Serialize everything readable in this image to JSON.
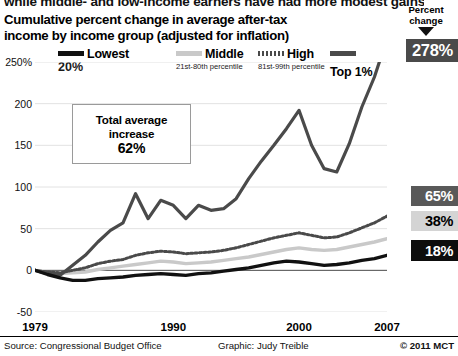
{
  "kicker": "while middle- and low-income earners have had more modest gains.",
  "title": {
    "line1": "Cumulative percent change in average after-tax",
    "line2": "income by income group (adjusted for inflation)"
  },
  "legend": [
    {
      "label": "Lowest",
      "sub_bold": "20%",
      "sub": "",
      "style": "solid-black",
      "color": "#111111"
    },
    {
      "label": "Middle",
      "sub_bold": "",
      "sub": "21st-80th\npercentile",
      "style": "solid-light",
      "color": "#c9c9c9"
    },
    {
      "label": "High",
      "sub_bold": "",
      "sub": "81st-99th\npercentile",
      "style": "dotted",
      "color": "#4a4a4a"
    },
    {
      "label": "Top 1%",
      "sub_bold": "",
      "sub": "",
      "style": "solid-dark",
      "color": "#4a4a4a"
    }
  ],
  "annotation_box": {
    "line1": "Total average",
    "line2": "increase",
    "value": "62%"
  },
  "percent_change_header": {
    "line1": "Percent",
    "line2": "change"
  },
  "callouts": [
    {
      "name": "top1",
      "value": "278%",
      "bg": "#4a4a4a",
      "fg": "#ffffff"
    },
    {
      "name": "high",
      "value": "65%",
      "bg": "#595959",
      "fg": "#ffffff"
    },
    {
      "name": "middle",
      "value": "38%",
      "bg": "#d4d4d4",
      "fg": "#000000"
    },
    {
      "name": "lowest",
      "value": "18%",
      "bg": "#0d0d0d",
      "fg": "#ffffff"
    }
  ],
  "footer": {
    "source": "Source: Congressional Budget Office",
    "graphic": "Graphic: Judy Treible",
    "copyright": "© 2011 MCT"
  },
  "chart_data": {
    "type": "line",
    "title": "Cumulative percent change in average after-tax income by income group (adjusted for inflation)",
    "xlabel": "",
    "ylabel": "",
    "xlim": [
      1979,
      2007
    ],
    "ylim": [
      -50,
      250
    ],
    "yticks": [
      250,
      200,
      150,
      100,
      50,
      0,
      -50
    ],
    "ytick_labels": [
      "250%",
      "200",
      "150",
      "100",
      "50",
      "0",
      "-50"
    ],
    "xticks": [
      1979,
      1990,
      2000,
      2007
    ],
    "xtick_labels": [
      "1979",
      "1990",
      "2000",
      "2007"
    ],
    "grid": true,
    "legend_position": "top",
    "x": [
      1979,
      1980,
      1981,
      1982,
      1983,
      1984,
      1985,
      1986,
      1987,
      1988,
      1989,
      1990,
      1991,
      1992,
      1993,
      1994,
      1995,
      1996,
      1997,
      1998,
      1999,
      2000,
      2001,
      2002,
      2003,
      2004,
      2005,
      2006,
      2007
    ],
    "series": [
      {
        "name": "Top 1%",
        "label": "Top 1%",
        "color": "#4a4a4a",
        "style": "solid",
        "width": 3.2,
        "end_value": 278,
        "values": [
          0,
          -4,
          -6,
          6,
          18,
          34,
          48,
          57,
          92,
          62,
          84,
          78,
          62,
          78,
          72,
          74,
          86,
          110,
          131,
          150,
          170,
          192,
          150,
          122,
          118,
          152,
          196,
          232,
          278
        ]
      },
      {
        "name": "High",
        "label": "High (81st-99th percentile)",
        "color": "#4a4a4a",
        "style": "dotted",
        "width": 3.0,
        "end_value": 65,
        "values": [
          0,
          -2,
          -3,
          0,
          3,
          8,
          11,
          13,
          18,
          21,
          23,
          22,
          20,
          21,
          22,
          24,
          27,
          31,
          35,
          39,
          42,
          45,
          42,
          39,
          40,
          45,
          51,
          57,
          65
        ]
      },
      {
        "name": "Middle",
        "label": "Middle (21st-80th percentile)",
        "color": "#c9c9c9",
        "style": "solid",
        "width": 3.4,
        "end_value": 38,
        "values": [
          0,
          -3,
          -4,
          -3,
          -2,
          1,
          3,
          5,
          7,
          9,
          11,
          10,
          8,
          9,
          10,
          12,
          14,
          16,
          19,
          22,
          25,
          27,
          25,
          24,
          25,
          28,
          31,
          34,
          38
        ]
      },
      {
        "name": "Lowest",
        "label": "Lowest 20%",
        "color": "#111111",
        "style": "solid",
        "width": 3.4,
        "end_value": 18,
        "values": [
          0,
          -5,
          -9,
          -12,
          -12,
          -10,
          -9,
          -8,
          -6,
          -5,
          -4,
          -5,
          -6,
          -4,
          -3,
          -1,
          1,
          3,
          6,
          9,
          11,
          10,
          8,
          6,
          7,
          9,
          12,
          14,
          18
        ]
      }
    ]
  }
}
